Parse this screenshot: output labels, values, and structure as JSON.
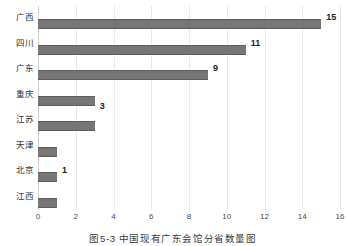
{
  "chart_data": {
    "type": "bar",
    "orientation": "horizontal",
    "title": "",
    "xlabel": "",
    "ylabel": "",
    "xlim": [
      0,
      16
    ],
    "xticks": [
      "0",
      "2",
      "4",
      "6",
      "8",
      "10",
      "12",
      "14",
      "16"
    ],
    "grid": "vertical",
    "legend": "none",
    "bar_color": "#767676",
    "gridline_color": "#e9e9e9",
    "categories": [
      "广西",
      "四川",
      "广东",
      "重庆",
      "江苏",
      "天津",
      "北京",
      "江西"
    ],
    "values": [
      15,
      11,
      9,
      3,
      3,
      1,
      1,
      1
    ],
    "point_labels": [
      {
        "category": "广西",
        "text": "15",
        "value": 15
      },
      {
        "category": "四川",
        "text": "11",
        "value": 11
      },
      {
        "category": "广东",
        "text": "9",
        "value": 9
      },
      {
        "category": "重庆",
        "text": "3",
        "value": 3
      },
      {
        "category": "北京",
        "text": "1",
        "value": 1
      }
    ]
  },
  "caption": {
    "text": "图5-3  中国现有广东会馆分省数量图"
  }
}
